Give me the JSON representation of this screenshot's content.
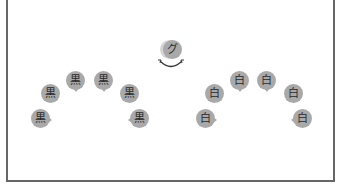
{
  "diagram": {
    "center_speaker": {
      "label": "グ",
      "swap_icon": "curved-double-arrow-icon"
    },
    "left_group": {
      "items": [
        {
          "label": "黒",
          "x": 31,
          "y": 109,
          "tail": "right"
        },
        {
          "label": "黒",
          "x": 41,
          "y": 84,
          "tail": "down-right"
        },
        {
          "label": "黒",
          "x": 66,
          "y": 71,
          "tail": "down"
        },
        {
          "label": "黒",
          "x": 94,
          "y": 71,
          "tail": "down"
        },
        {
          "label": "黒",
          "x": 120,
          "y": 84,
          "tail": "down-left"
        },
        {
          "label": "黒",
          "x": 130,
          "y": 109,
          "tail": "left"
        }
      ]
    },
    "right_group": {
      "items": [
        {
          "label": "白",
          "x": 196,
          "y": 109,
          "tail": "right"
        },
        {
          "label": "白",
          "x": 205,
          "y": 84,
          "tail": "down-right"
        },
        {
          "label": "白",
          "x": 230,
          "y": 71,
          "tail": "down"
        },
        {
          "label": "白",
          "x": 257,
          "y": 71,
          "tail": "down"
        },
        {
          "label": "白",
          "x": 284,
          "y": 84,
          "tail": "down-left"
        },
        {
          "label": "白",
          "x": 293,
          "y": 109,
          "tail": "left"
        }
      ]
    },
    "colors": {
      "bubble": "#a9a9a9",
      "frame": "#666666",
      "text": "#2a2a2a"
    }
  }
}
